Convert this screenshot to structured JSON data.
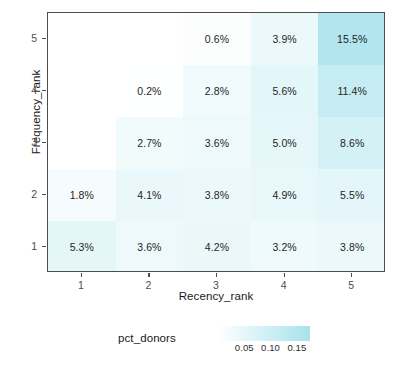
{
  "chart_data": {
    "type": "heatmap",
    "title": "",
    "xlabel": "Recency_rank",
    "ylabel": "Frequency_rank",
    "x_categories": [
      "1",
      "2",
      "3",
      "4",
      "5"
    ],
    "y_categories": [
      "1",
      "2",
      "3",
      "4",
      "5"
    ],
    "value_unit": "percent",
    "grid": false,
    "legend": {
      "title": "pct_donors",
      "position": "bottom",
      "type": "continuous-colorbar",
      "ticks": [
        "0.05",
        "0.10",
        "0.15"
      ],
      "tick_values": [
        0.05,
        0.1,
        0.15
      ],
      "low_color": "#ffffff",
      "high_color": "#a8e2ec",
      "range": [
        0.0,
        0.175
      ]
    },
    "cells": [
      {
        "x": "1",
        "y": "5",
        "value": null,
        "label": ""
      },
      {
        "x": "2",
        "y": "5",
        "value": null,
        "label": ""
      },
      {
        "x": "3",
        "y": "5",
        "value": 0.006,
        "label": "0.6%"
      },
      {
        "x": "4",
        "y": "5",
        "value": 0.039,
        "label": "3.9%"
      },
      {
        "x": "5",
        "y": "5",
        "value": 0.155,
        "label": "15.5%"
      },
      {
        "x": "1",
        "y": "4",
        "value": null,
        "label": ""
      },
      {
        "x": "2",
        "y": "4",
        "value": 0.002,
        "label": "0.2%"
      },
      {
        "x": "3",
        "y": "4",
        "value": 0.028,
        "label": "2.8%"
      },
      {
        "x": "4",
        "y": "4",
        "value": 0.056,
        "label": "5.6%"
      },
      {
        "x": "5",
        "y": "4",
        "value": 0.114,
        "label": "11.4%"
      },
      {
        "x": "1",
        "y": "3",
        "value": null,
        "label": ""
      },
      {
        "x": "2",
        "y": "3",
        "value": 0.027,
        "label": "2.7%"
      },
      {
        "x": "3",
        "y": "3",
        "value": 0.036,
        "label": "3.6%"
      },
      {
        "x": "4",
        "y": "3",
        "value": 0.05,
        "label": "5.0%"
      },
      {
        "x": "5",
        "y": "3",
        "value": 0.086,
        "label": "8.6%"
      },
      {
        "x": "1",
        "y": "2",
        "value": 0.018,
        "label": "1.8%"
      },
      {
        "x": "2",
        "y": "2",
        "value": 0.041,
        "label": "4.1%"
      },
      {
        "x": "3",
        "y": "2",
        "value": 0.038,
        "label": "3.8%"
      },
      {
        "x": "4",
        "y": "2",
        "value": 0.049,
        "label": "4.9%"
      },
      {
        "x": "5",
        "y": "2",
        "value": 0.055,
        "label": "5.5%"
      },
      {
        "x": "1",
        "y": "1",
        "value": 0.053,
        "label": "5.3%"
      },
      {
        "x": "2",
        "y": "1",
        "value": 0.036,
        "label": "3.6%"
      },
      {
        "x": "3",
        "y": "1",
        "value": 0.042,
        "label": "4.2%"
      },
      {
        "x": "4",
        "y": "1",
        "value": 0.032,
        "label": "3.2%"
      },
      {
        "x": "5",
        "y": "1",
        "value": 0.038,
        "label": "3.8%"
      }
    ]
  }
}
